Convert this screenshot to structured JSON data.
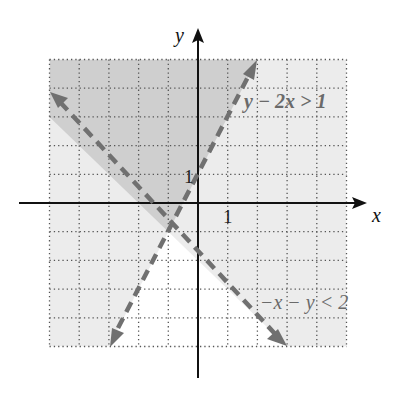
{
  "figure": {
    "type": "system-of-inequalities-graph",
    "axes": {
      "x_label": "x",
      "y_label": "y",
      "x_tick_label": "1",
      "y_tick_label": "1",
      "x_range": [
        -5,
        5
      ],
      "y_range": [
        -5,
        5
      ],
      "grid": "dotted, unit spacing"
    },
    "inequalities": [
      {
        "label": "y − 2x > 1",
        "boundary": "y = 2x + 1",
        "style": "dashed",
        "side": "above-left"
      },
      {
        "label": "−x − y < 2",
        "boundary": "y = −x − 2",
        "style": "dashed",
        "side": "above-right"
      }
    ],
    "intersection_point": [
      -1,
      -1
    ],
    "colors": {
      "overlap_shade": "#cfcfcf",
      "single_shade": "#ececec",
      "unshaded": "#ffffff",
      "boundary_line": "#707070",
      "axis": "#111111",
      "grid_dots": "#555555"
    }
  }
}
